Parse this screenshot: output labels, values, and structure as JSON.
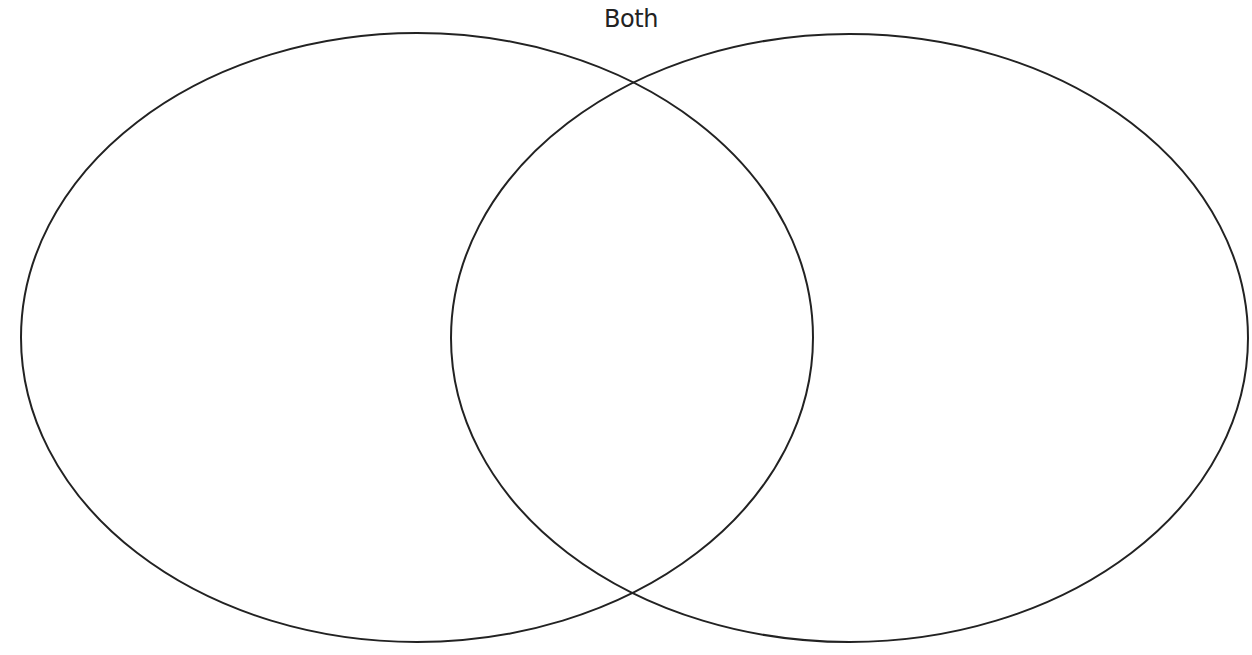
{
  "diagram": {
    "type": "venn",
    "overlap_label": "Both",
    "stroke_color": "#222222",
    "background_color": "#ffffff",
    "circles": [
      {
        "name": "left-set",
        "label": "",
        "cx": 417,
        "cy": 337.5,
        "rx": 396,
        "ry": 304.5
      },
      {
        "name": "right-set",
        "label": "",
        "cx": 849.5,
        "cy": 338,
        "rx": 398.5,
        "ry": 304
      }
    ]
  }
}
